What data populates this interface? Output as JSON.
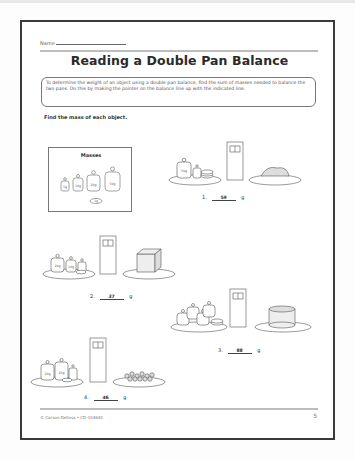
{
  "header": {
    "name_label": "Name",
    "title": "Reading a Double Pan Balance"
  },
  "instructions": "To determine the weight of an object using a double pan balance, find the sum of masses needed to balance the two pans. Do this by making the pointer on the balance line up with the indicated line.",
  "task": "Find the mass of each object.",
  "masses": {
    "title": "Masses",
    "items": [
      "5g",
      "10g",
      "20g",
      "50g",
      "1g"
    ]
  },
  "problems": [
    {
      "number": "1.",
      "answer": "59",
      "unit": "g",
      "weights": [
        "50g",
        "5g",
        "1g"
      ],
      "object": "cookies"
    },
    {
      "number": "2.",
      "answer": "37",
      "unit": "g",
      "weights": [
        "20g",
        "10g",
        "5g",
        "1g"
      ],
      "object": "juice box"
    },
    {
      "number": "3.",
      "answer": "88",
      "unit": "g",
      "weights": [
        "20g",
        "20g",
        "20g",
        "20g",
        "5g",
        "1g"
      ],
      "object": "cake"
    },
    {
      "number": "4.",
      "answer": "46",
      "unit": "g",
      "weights": [
        "20g",
        "20g",
        "5g",
        "1g"
      ],
      "object": "cereal"
    }
  ],
  "footer": {
    "copyright": "© Carson-Dellosa • CD-104640",
    "page_number": "5"
  }
}
